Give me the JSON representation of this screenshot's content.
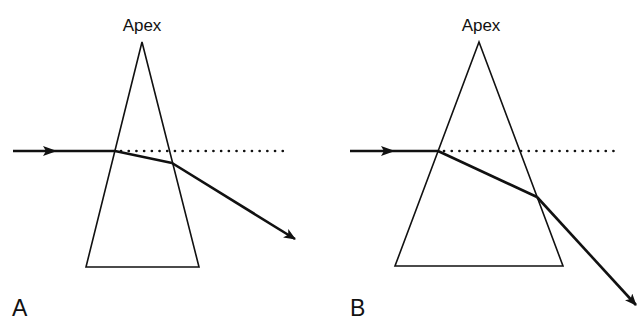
{
  "figure": {
    "panels": [
      {
        "id": "A",
        "panel_label": "A",
        "apex_label": "Apex",
        "prism": {
          "apex": [
            142,
            42
          ],
          "base_left": [
            86,
            267
          ],
          "base_right": [
            199,
            267
          ]
        },
        "incident_ray": {
          "from": [
            13,
            151
          ],
          "to": [
            115,
            151
          ],
          "arrow_at": [
            55,
            151
          ]
        },
        "internal_ray": {
          "from": [
            115,
            151
          ],
          "to": [
            172,
            163
          ]
        },
        "emergent_ray": {
          "from": [
            172,
            163
          ],
          "to": [
            295,
            239
          ]
        },
        "reference_line": {
          "from": [
            121,
            151
          ],
          "to": [
            290,
            151
          ],
          "style": "dotted"
        }
      },
      {
        "id": "B",
        "panel_label": "B",
        "apex_label": "Apex",
        "prism": {
          "apex": [
            479,
            42
          ],
          "base_left": [
            395,
            266
          ],
          "base_right": [
            563,
            266
          ]
        },
        "incident_ray": {
          "from": [
            350,
            151
          ],
          "to": [
            438,
            151
          ],
          "arrow_at": [
            392,
            151
          ]
        },
        "internal_ray": {
          "from": [
            438,
            151
          ],
          "to": [
            537,
            197
          ]
        },
        "emergent_ray": {
          "from": [
            537,
            197
          ],
          "to": [
            636,
            305
          ]
        },
        "reference_line": {
          "from": [
            444,
            151
          ],
          "to": [
            620,
            151
          ],
          "style": "dotted"
        }
      }
    ],
    "colors": {
      "line": "#111111",
      "background": "#ffffff"
    }
  }
}
